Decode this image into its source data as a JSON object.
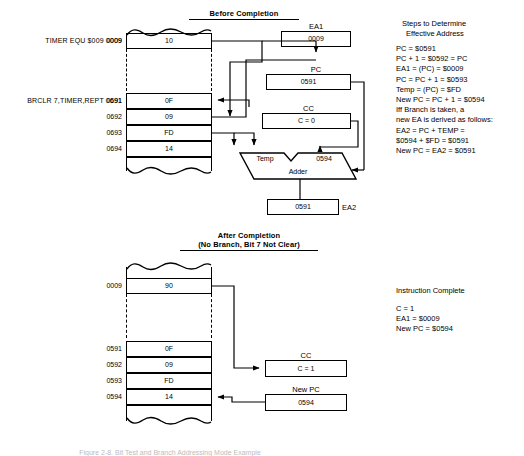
{
  "figure": {
    "top_section_title": "Before Completion",
    "bottom_section_title_line1": "After Completion",
    "bottom_section_title_line2": "(No Branch, Bit 7 Not Clear)"
  },
  "top": {
    "memory_labels": {
      "timer": "TIMER EQU $009 0009",
      "brclr": "BRCLR 7,TIMER,REPT 0691"
    },
    "memory_rows": [
      {
        "address": "0009",
        "value": "10"
      },
      {
        "address": "0691",
        "value": "0F"
      },
      {
        "address": "0692",
        "value": "09"
      },
      {
        "address": "0693",
        "value": "FD"
      },
      {
        "address": "0694",
        "value": "14"
      }
    ],
    "registers": [
      {
        "name": "EA1",
        "value": "0009"
      },
      {
        "name": "PC",
        "value": "0591"
      },
      {
        "name": "CC",
        "value": "C = 0"
      },
      {
        "name": "EA2",
        "value": "0591"
      }
    ],
    "adder": {
      "left_input": "Temp",
      "right_input": "0594",
      "label": "Adder"
    }
  },
  "bottom": {
    "memory_rows": [
      {
        "address": "0009",
        "value": "90"
      },
      {
        "address": "0591",
        "value": "0F"
      },
      {
        "address": "0592",
        "value": "09"
      },
      {
        "address": "0593",
        "value": "FD"
      },
      {
        "address": "0594",
        "value": "14"
      }
    ],
    "registers": [
      {
        "name": "CC",
        "value": "C = 1"
      },
      {
        "name": "New PC",
        "value": "0594"
      }
    ]
  },
  "notes_top": {
    "heading_line1": "Steps to Determine",
    "heading_line2": "Effective Address",
    "lines": [
      "PC = $0591",
      "PC + 1 = $0592 = PC",
      "EA1 = (PC) = $0009",
      "PC = PC + 1 = $0593",
      "Temp = (PC) = $FD",
      "New PC = PC + 1 = $0594",
      "Iff Branch is taken, a",
      "new EA is derived as follows:",
      "EA2 = PC + TEMP =",
      "   $0594 + $FD = $0591",
      "New PC = EA2 = $0591"
    ]
  },
  "notes_bottom": {
    "heading": "Instruction Complete",
    "lines": [
      "C = 1",
      "EA1 = $0009",
      "New PC = $0594"
    ]
  },
  "caption": {
    "text": "Figure 2-8. Bit Test and Branch Addressing Mode Example"
  }
}
